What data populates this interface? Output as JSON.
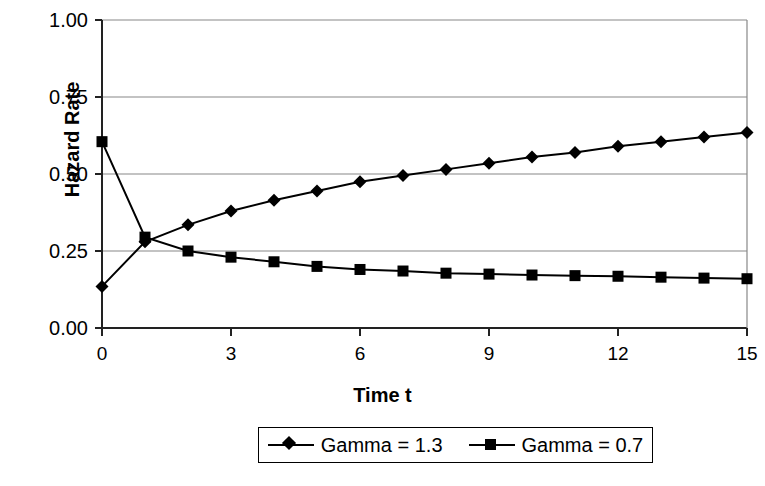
{
  "chart_data": {
    "type": "line",
    "title": "",
    "xlabel": "Time t",
    "ylabel": "Hazard Rate",
    "xlim": [
      0,
      15
    ],
    "ylim": [
      0,
      1.0
    ],
    "xticks": [
      "0",
      "3",
      "6",
      "9",
      "12",
      "15"
    ],
    "xtick_values": [
      0,
      3,
      6,
      9,
      12,
      15
    ],
    "yticks": [
      "0.00",
      "0.25",
      "0.50",
      "0.75",
      "1.00"
    ],
    "ytick_values": [
      0.0,
      0.25,
      0.5,
      0.75,
      1.0
    ],
    "grid": "horizontal",
    "legend_position": "bottom",
    "x": [
      0,
      1,
      2,
      3,
      4,
      5,
      6,
      7,
      8,
      9,
      10,
      11,
      12,
      13,
      14,
      15
    ],
    "series": [
      {
        "name": "Gamma = 1.3",
        "marker": "diamond",
        "color": "#000000",
        "values": [
          0.135,
          0.28,
          0.335,
          0.38,
          0.415,
          0.445,
          0.475,
          0.495,
          0.515,
          0.535,
          0.555,
          0.57,
          0.59,
          0.605,
          0.62,
          0.635
        ]
      },
      {
        "name": "Gamma = 0.7",
        "marker": "square",
        "color": "#000000",
        "values": [
          0.605,
          0.295,
          0.25,
          0.23,
          0.215,
          0.2,
          0.19,
          0.185,
          0.178,
          0.175,
          0.172,
          0.17,
          0.168,
          0.165,
          0.162,
          0.16
        ]
      }
    ]
  },
  "axes": {
    "plot_left": 102,
    "plot_right": 747,
    "plot_top": 20,
    "plot_bottom": 328
  },
  "legend": {
    "entries": [
      {
        "label": "Gamma = 1.3",
        "marker": "diamond"
      },
      {
        "label": "Gamma = 0.7",
        "marker": "square"
      }
    ]
  }
}
